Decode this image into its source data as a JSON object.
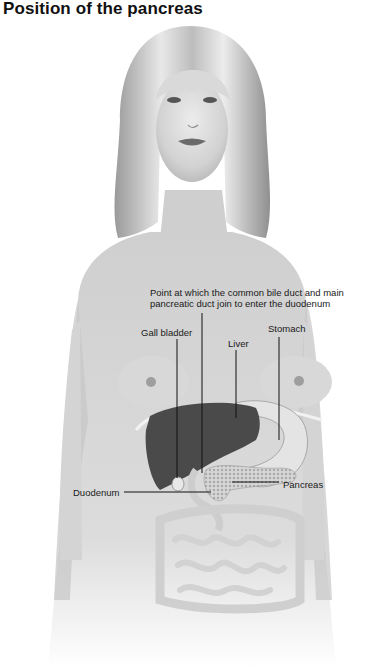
{
  "title": "Position of the pancreas",
  "labels": {
    "duct_junction_line1": "Point at which the common bile duct and main",
    "duct_junction_line2": "pancreatic duct join to enter the duodenum",
    "gall_bladder": "Gall bladder",
    "stomach": "Stomach",
    "liver": "Liver",
    "pancreas": "Pancreas",
    "duodenum": "Duodenum"
  },
  "colors": {
    "background": "#ffffff",
    "skin_shade": "#c9c9c9",
    "liver": "#4a4a4a",
    "leader_line": "#111111"
  }
}
